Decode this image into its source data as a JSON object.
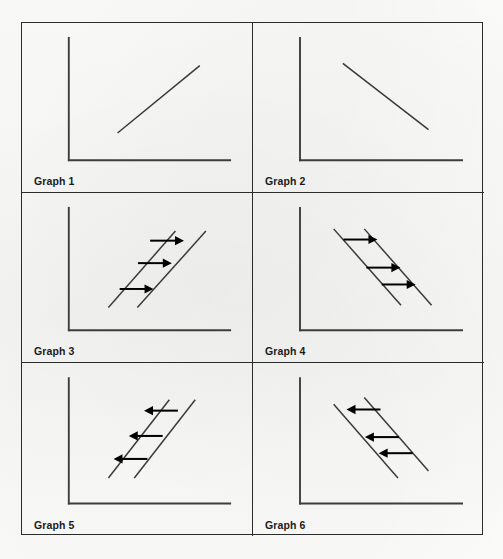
{
  "figure": {
    "kind": "economics-graph-grid",
    "columns": 2,
    "rows": 3,
    "border_color": "#2b2b2b",
    "line_color": "#3a3a3a",
    "arrow_color": "#000000",
    "background_color": "#fbfbfa"
  },
  "chart_data": [
    {
      "type": "line",
      "title": "Graph 1",
      "label": "Graph 1",
      "xlabel": "",
      "ylabel": "",
      "grid": false,
      "legend": "none",
      "axes": {
        "x_axis": true,
        "y_axis": true
      },
      "description": "Single upward-sloping straight line",
      "series": [
        {
          "name": "line-1",
          "direction": "upward",
          "x": [
            0.32,
            0.86
          ],
          "y": [
            0.18,
            0.78
          ]
        }
      ],
      "arrows": []
    },
    {
      "type": "line",
      "title": "Graph 2",
      "label": "Graph 2",
      "xlabel": "",
      "ylabel": "",
      "grid": false,
      "legend": "none",
      "axes": {
        "x_axis": true,
        "y_axis": true
      },
      "description": "Single downward-sloping straight line",
      "series": [
        {
          "name": "line-1",
          "direction": "downward",
          "x": [
            0.28,
            0.84
          ],
          "y": [
            0.8,
            0.21
          ]
        }
      ],
      "arrows": []
    },
    {
      "type": "line",
      "title": "Graph 3",
      "label": "Graph 3",
      "xlabel": "",
      "ylabel": "",
      "grid": false,
      "legend": "none",
      "axes": {
        "x_axis": true,
        "y_axis": true
      },
      "description": "Two parallel upward-sloping lines with three rightward shift arrows",
      "series": [
        {
          "name": "line-original",
          "direction": "upward",
          "x": [
            0.26,
            0.7
          ],
          "y": [
            0.14,
            0.82
          ]
        },
        {
          "name": "line-shifted",
          "direction": "upward",
          "x": [
            0.45,
            0.9
          ],
          "y": [
            0.14,
            0.82
          ]
        }
      ],
      "arrows": [
        {
          "direction": "right",
          "x": 0.645,
          "y": 0.735
        },
        {
          "direction": "right",
          "x": 0.565,
          "y": 0.535
        },
        {
          "direction": "right",
          "x": 0.445,
          "y": 0.305
        }
      ]
    },
    {
      "type": "line",
      "title": "Graph 4",
      "label": "Graph 4",
      "xlabel": "",
      "ylabel": "",
      "grid": false,
      "legend": "none",
      "axes": {
        "x_axis": true,
        "y_axis": true
      },
      "description": "Two parallel downward-sloping lines with three rightward shift arrows",
      "series": [
        {
          "name": "line-original",
          "direction": "downward",
          "x": [
            0.22,
            0.66
          ],
          "y": [
            0.84,
            0.16
          ]
        },
        {
          "name": "line-shifted",
          "direction": "downward",
          "x": [
            0.42,
            0.86
          ],
          "y": [
            0.84,
            0.16
          ]
        }
      ],
      "arrows": [
        {
          "direction": "right",
          "x": 0.395,
          "y": 0.745
        },
        {
          "direction": "right",
          "x": 0.545,
          "y": 0.495
        },
        {
          "direction": "right",
          "x": 0.645,
          "y": 0.345
        }
      ]
    },
    {
      "type": "line",
      "title": "Graph 5",
      "label": "Graph 5",
      "xlabel": "",
      "ylabel": "",
      "grid": false,
      "legend": "none",
      "axes": {
        "x_axis": true,
        "y_axis": true
      },
      "description": "Two parallel upward-sloping lines with three leftward shift arrows",
      "series": [
        {
          "name": "line-original",
          "direction": "upward",
          "x": [
            0.26,
            0.66
          ],
          "y": [
            0.16,
            0.84
          ]
        },
        {
          "name": "line-shifted",
          "direction": "upward",
          "x": [
            0.43,
            0.83
          ],
          "y": [
            0.16,
            0.84
          ]
        }
      ],
      "arrows": [
        {
          "direction": "left",
          "x": 0.605,
          "y": 0.745
        },
        {
          "direction": "left",
          "x": 0.505,
          "y": 0.525
        },
        {
          "direction": "left",
          "x": 0.405,
          "y": 0.325
        }
      ]
    },
    {
      "type": "line",
      "title": "Graph 6",
      "label": "Graph 6",
      "xlabel": "",
      "ylabel": "",
      "grid": false,
      "legend": "none",
      "axes": {
        "x_axis": true,
        "y_axis": true
      },
      "description": "Two parallel downward-sloping lines with three leftward shift arrows",
      "series": [
        {
          "name": "line-original",
          "direction": "downward",
          "x": [
            0.22,
            0.64
          ],
          "y": [
            0.8,
            0.16
          ]
        },
        {
          "name": "line-shifted",
          "direction": "downward",
          "x": [
            0.42,
            0.84
          ],
          "y": [
            0.86,
            0.22
          ]
        }
      ],
      "arrows": [
        {
          "direction": "left",
          "x": 0.415,
          "y": 0.755
        },
        {
          "direction": "left",
          "x": 0.535,
          "y": 0.515
        },
        {
          "direction": "left",
          "x": 0.625,
          "y": 0.375
        }
      ]
    }
  ]
}
